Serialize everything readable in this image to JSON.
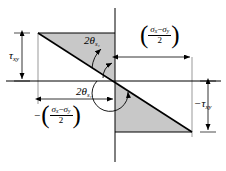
{
  "figure": {
    "name": "mohr-circle-stress-geometry",
    "type": "geometric-construction",
    "background_color": "#ffffff",
    "line_color": "#000000",
    "shade_color": "#c8c8c8"
  },
  "axes": {
    "horizontal": {
      "name": "horizontal-axis",
      "y": 81,
      "x_start": 6,
      "x_end": 221
    },
    "vertical": {
      "name": "vertical-axis",
      "x": 115,
      "y_start": 8,
      "y_end": 162
    }
  },
  "shapes": {
    "upper_left_triangle": {
      "name": "upper-left-shaded-triangle",
      "points": "38,33 115,33 115,81",
      "fill": "#c8c8c8"
    },
    "lower_right_triangle": {
      "name": "lower-right-shaded-triangle",
      "points": "115,81 115,132 192,132",
      "fill": "#c8c8c8"
    },
    "diagonal": {
      "name": "main-diagonal-line",
      "x1": 38,
      "y1": 33,
      "x2": 192,
      "y2": 132
    }
  },
  "labels": {
    "tau_upper_left": {
      "name": "tau-xy-label",
      "symbol": "τ",
      "subscript": "xy",
      "prefix": "",
      "x": 10,
      "y": 52
    },
    "tau_lower_right": {
      "name": "negative-tau-xy-label",
      "symbol": "τ",
      "subscript": "xy",
      "prefix": "−",
      "x": 196,
      "y": 100
    },
    "angle_upper": {
      "name": "two-theta-s1-upper-label",
      "text": "2θ",
      "subscript": "s₁",
      "x": 84,
      "y": 36
    },
    "angle_lower": {
      "name": "two-theta-s1-lower-label",
      "text": "2θ",
      "subscript": "s₁",
      "x": 76,
      "y": 87
    },
    "expr_upper_right": {
      "name": "sigma-difference-over-two-positive",
      "sign": "",
      "numerator_left": "σ",
      "numerator_left_sub": "x",
      "operator": "−",
      "numerator_right": "σ",
      "numerator_right_sub": "y",
      "denominator": "2",
      "x": 141,
      "y": 27
    },
    "expr_lower_left": {
      "name": "sigma-difference-over-two-negative",
      "sign": "−",
      "numerator_left": "σ",
      "numerator_left_sub": "x",
      "operator": "−",
      "numerator_right": "σ",
      "numerator_right_sub": "y",
      "denominator": "2",
      "x": 37,
      "y": 107
    }
  },
  "dimension_lines": [
    {
      "name": "tau-upper-left-dimension",
      "orientation": "vertical",
      "x": 22,
      "y1": 33,
      "y2": 81
    },
    {
      "name": "tau-lower-right-dimension",
      "orientation": "vertical",
      "x": 208,
      "y1": 81,
      "y2": 132
    },
    {
      "name": "sigma-upper-right-dimension",
      "orientation": "horizontal",
      "y": 57,
      "x1": 115,
      "x2": 192
    },
    {
      "name": "sigma-lower-left-dimension",
      "orientation": "horizontal",
      "y": 99,
      "x1": 38,
      "x2": 115
    }
  ],
  "extension_lines": [
    {
      "name": "left-vertical-extension",
      "x": 38,
      "y1": 33,
      "y2": 104
    },
    {
      "name": "right-vertical-extension",
      "x": 192,
      "y1": 57,
      "y2": 137
    }
  ],
  "arcs": [
    {
      "name": "upper-angle-arc",
      "description": "arc from diagonal up to positive horizontal axis"
    },
    {
      "name": "lower-angle-arc",
      "description": "arc from negative horizontal axis around to diagonal"
    }
  ]
}
